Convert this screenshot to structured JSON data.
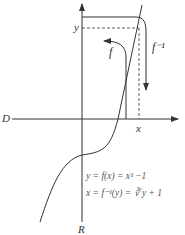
{
  "diagram": {
    "axis_labels": {
      "domain": "D",
      "range": "R",
      "x": "x",
      "y": "y"
    },
    "arrow_labels": {
      "f": "f",
      "f_inverse": "f⁻¹"
    },
    "equations": [
      "y = f(x) = x³ −1",
      "x = f⁻¹(y) = ∛ y + 1"
    ],
    "colors": {
      "lines": "#333333",
      "text": "#333333"
    }
  }
}
